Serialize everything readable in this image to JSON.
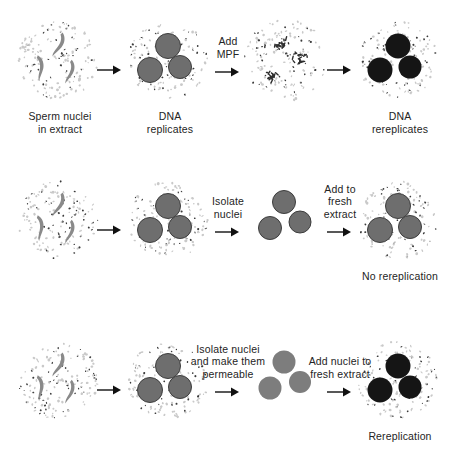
{
  "figure": {
    "type": "diagram",
    "background_color": "#ffffff",
    "ink_color": "#242424"
  },
  "palette": {
    "extract_speckle_light": "#c9c9c9",
    "extract_speckle_dark": "#3a3a3a",
    "sperm_gray": "#8a8a8a",
    "nucleus_gray": "#6e6e6e",
    "nucleus_gray_outline": "#3d3d3d",
    "nucleus_permeable": "#7d7d7d",
    "nucleus_dark": "#151515",
    "arrow": "#111111",
    "text": "#242424"
  },
  "rows": [
    {
      "id": "row-1-mpf",
      "stages": [
        {
          "id": "r1-s1",
          "kind": "extract-sperm",
          "caption": "Sperm nuclei\nin extract",
          "caption_visible": true
        },
        {
          "id": "r1-s2",
          "kind": "extract-nuclei",
          "nucleus_shade": "gray",
          "caption": "DNA\nreplicates",
          "caption_visible": true
        },
        {
          "id": "r1-s3",
          "kind": "extract-chromatin",
          "caption": "",
          "caption_visible": false
        },
        {
          "id": "r1-s4",
          "kind": "extract-nuclei",
          "nucleus_shade": "dark",
          "caption": "DNA\nrereplicates",
          "caption_visible": true
        }
      ],
      "arrows": [
        {
          "id": "r1-a1",
          "label": ""
        },
        {
          "id": "r1-a2",
          "label": "Add\nMPF"
        },
        {
          "id": "r1-a3",
          "label": ""
        }
      ]
    },
    {
      "id": "row-2-no-rereplication",
      "stages": [
        {
          "id": "r2-s1",
          "kind": "extract-sperm",
          "caption": "",
          "caption_visible": false
        },
        {
          "id": "r2-s2",
          "kind": "extract-nuclei",
          "nucleus_shade": "gray",
          "caption": "",
          "caption_visible": false
        },
        {
          "id": "r2-s3",
          "kind": "bare-nuclei",
          "nucleus_shade": "gray",
          "caption": "",
          "caption_visible": false
        },
        {
          "id": "r2-s4",
          "kind": "extract-nuclei",
          "nucleus_shade": "gray",
          "caption": "No rereplication",
          "caption_visible": true
        }
      ],
      "arrows": [
        {
          "id": "r2-a1",
          "label": ""
        },
        {
          "id": "r2-a2",
          "label": "Isolate\nnuclei"
        },
        {
          "id": "r2-a3",
          "label": "Add to\nfresh\nextract"
        }
      ]
    },
    {
      "id": "row-3-rereplication",
      "stages": [
        {
          "id": "r3-s1",
          "kind": "extract-sperm",
          "caption": "",
          "caption_visible": false
        },
        {
          "id": "r3-s2",
          "kind": "extract-nuclei",
          "nucleus_shade": "gray",
          "caption": "",
          "caption_visible": false
        },
        {
          "id": "r3-s3",
          "kind": "bare-nuclei",
          "nucleus_shade": "permeable",
          "caption": "",
          "caption_visible": false
        },
        {
          "id": "r3-s4",
          "kind": "extract-nuclei",
          "nucleus_shade": "dark",
          "caption": "Rereplication",
          "caption_visible": true
        }
      ],
      "arrows": [
        {
          "id": "r3-a1",
          "label": ""
        },
        {
          "id": "r3-a2",
          "label": "Isolate nuclei\nand make them\npermeable"
        },
        {
          "id": "r3-a3",
          "label": "Add nuclei to\nfresh extract"
        }
      ]
    }
  ],
  "layout": {
    "row_tops": [
      20,
      180,
      340
    ],
    "stage_x": [
      12,
      122,
      240,
      352
    ],
    "arrow_x": [
      96,
      214,
      326
    ],
    "panel_size": 96
  }
}
